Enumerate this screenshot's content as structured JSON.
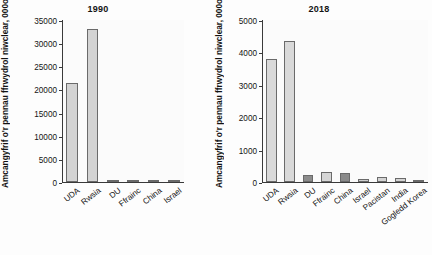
{
  "chart_data": [
    {
      "type": "bar",
      "title": "1990",
      "xlabel": "",
      "ylabel": "Amcangyfrif o'r pennau ffrwydrol niwclear, 000oedd",
      "categories": [
        "UDA",
        "Rwsia",
        "DU",
        "Ffrainc",
        "China",
        "Israel"
      ],
      "values": [
        21500,
        33000,
        350,
        500,
        240,
        53
      ],
      "bar_colors": [
        "#d3d3d3",
        "#d3d3d3",
        "#d3d3d3",
        "#d3d3d3",
        "#d3d3d3",
        "#d3d3d3"
      ],
      "ylim": [
        0,
        35000
      ],
      "yticks": [
        0,
        5000,
        10000,
        15000,
        20000,
        25000,
        30000,
        35000
      ],
      "ytick_labels": [
        "0",
        "5000",
        "10000",
        "15000",
        "20000",
        "25000",
        "30000",
        "35000"
      ],
      "grid": false,
      "legend": "none"
    },
    {
      "type": "bar",
      "title": "2018",
      "xlabel": "",
      "ylabel": "Amcangyfrif o'r pennau ffrwydrol niwclear, 000oedd",
      "categories": [
        "UDA",
        "Rwsia",
        "DU",
        "Ffrainc",
        "China",
        "Israel",
        "Pacistan",
        "India",
        "Gogledd Korea"
      ],
      "values": [
        3800,
        4350,
        215,
        300,
        280,
        80,
        140,
        130,
        40
      ],
      "bar_colors": [
        "#d9d9d9",
        "#d9d9d9",
        "#8c8c8c",
        "#d6d6d6",
        "#8a8a8a",
        "#cfcfcf",
        "#d4d4d4",
        "#d4d4d4",
        "#b5b5b5"
      ],
      "ylim": [
        0,
        5000
      ],
      "yticks": [
        0,
        1000,
        2000,
        3000,
        4000,
        5000
      ],
      "ytick_labels": [
        "0",
        "1000",
        "2000",
        "3000",
        "4000",
        "5000"
      ],
      "grid": false,
      "legend": "none"
    }
  ],
  "panels": {
    "left": {
      "title": "1990",
      "ylabel": "Amcangyfrif o'r pennau ffrwydrol niwclear, 000oedd"
    },
    "right": {
      "title": "2018",
      "ylabel": "Amcangyfrif o'r pennau ffrwydrol niwclear, 000oedd"
    }
  },
  "colors": {
    "axis": "#3a3a3a",
    "bar_light": "#d3d3d3",
    "bar_dark": "#8c8c8c",
    "text": "#141414",
    "background": "#fdfdfd"
  }
}
